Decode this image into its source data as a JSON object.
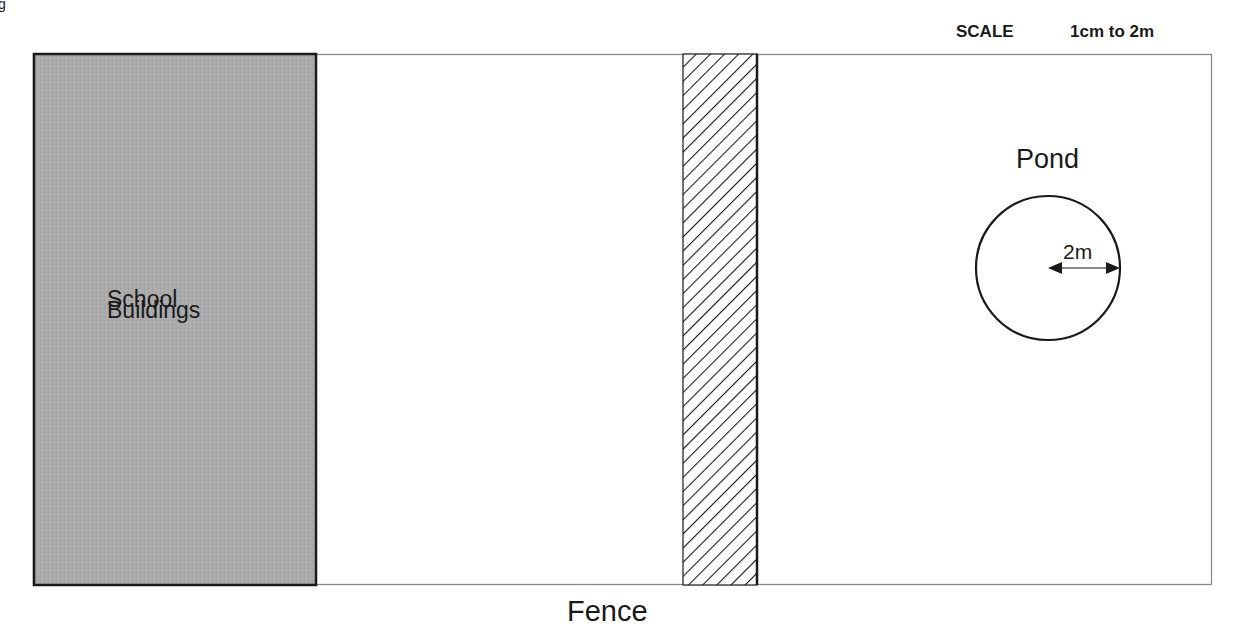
{
  "page_fragment": "g",
  "scale": {
    "title": "SCALE",
    "value": "1cm to 2m"
  },
  "regions": {
    "school_buildings": {
      "line1": "School",
      "line2": "Buildings",
      "fill_color": "#a9a9a9"
    },
    "fence": {
      "label": "Fence"
    },
    "pond": {
      "label": "Pond",
      "radius_label": "2m"
    }
  },
  "colors": {
    "outline": "#1a1a1a",
    "field_border": "#8a8a8a"
  }
}
